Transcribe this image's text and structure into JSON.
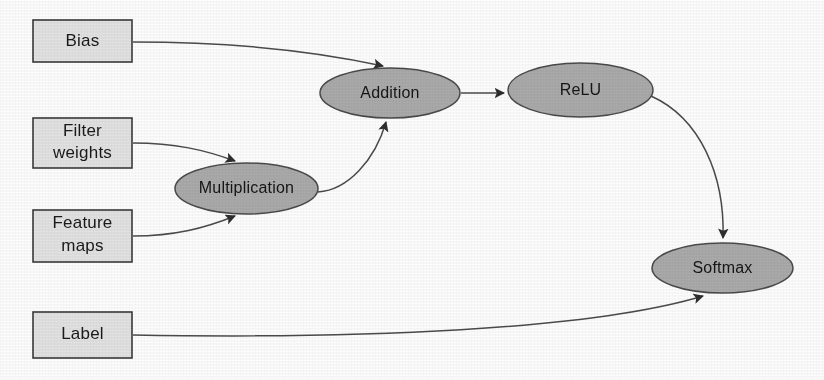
{
  "diagram": {
    "background_color": "#fdfdfd",
    "box_fill_color": "#e2e2e2",
    "box_border_color": "#3a3a3a",
    "ellipse_fill_color": "#aaaaaa",
    "ellipse_border_color": "#4a4a4a",
    "edge_color": "#4b4b4b",
    "input_nodes": [
      {
        "id": "bias",
        "label": "Bias",
        "shape": "rectangle"
      },
      {
        "id": "filter-weights",
        "label": "Filter\nweights",
        "line1": "Filter",
        "line2": "weights",
        "shape": "rectangle"
      },
      {
        "id": "feature-maps",
        "label": "Feature\nmaps",
        "line1": "Feature",
        "line2": "maps",
        "shape": "rectangle"
      },
      {
        "id": "label",
        "label": "Label",
        "shape": "rectangle"
      }
    ],
    "operation_nodes": [
      {
        "id": "multiplication",
        "label": "Multiplication",
        "shape": "ellipse"
      },
      {
        "id": "addition",
        "label": "Addition",
        "shape": "ellipse"
      },
      {
        "id": "relu",
        "label": "ReLU",
        "shape": "ellipse"
      },
      {
        "id": "softmax",
        "label": "Softmax",
        "shape": "ellipse"
      }
    ],
    "edges": [
      {
        "id": "bias-to-addition",
        "from": "bias",
        "to": "addition",
        "arrow": true
      },
      {
        "id": "filter-weights-to-multiplication",
        "from": "filter-weights",
        "to": "multiplication",
        "arrow": true
      },
      {
        "id": "feature-maps-to-multiplication",
        "from": "feature-maps",
        "to": "multiplication",
        "arrow": true
      },
      {
        "id": "multiplication-to-addition",
        "from": "multiplication",
        "to": "addition",
        "arrow": true
      },
      {
        "id": "addition-to-relu",
        "from": "addition",
        "to": "relu",
        "arrow": true
      },
      {
        "id": "relu-to-softmax",
        "from": "relu",
        "to": "softmax",
        "arrow": true
      },
      {
        "id": "label-to-softmax",
        "from": "label",
        "to": "softmax",
        "arrow": true
      }
    ]
  }
}
